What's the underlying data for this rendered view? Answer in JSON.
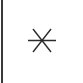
{
  "tile": {
    "width_px": 83,
    "height_px": 83,
    "background_color": "#ffffff"
  },
  "left_rule": {
    "name": "vertical-rule",
    "color": "#3a3a3a",
    "thickness_px": 2,
    "x_px": 1,
    "full_height": true
  },
  "glyph": {
    "character": "✳",
    "semantic_name": "asterisk-glyph",
    "description": "six-spoke asterisk: two diagonal strokes plus one horizontal bar",
    "color": "#2b2b2b",
    "spokes": 6,
    "has_horizontal_bar": true,
    "center_x_px": 42,
    "center_y_px": 40,
    "bbox": {
      "x": 27,
      "y": 28,
      "width": 30,
      "height": 25
    },
    "horizontal_bar": {
      "x1": 28,
      "y1": 40,
      "x2": 56,
      "y2": 40
    },
    "diagonals": [
      {
        "x1": 33,
        "y1": 29,
        "x2": 51,
        "y2": 51
      },
      {
        "x1": 51,
        "y1": 29,
        "x2": 33,
        "y2": 51
      }
    ]
  }
}
